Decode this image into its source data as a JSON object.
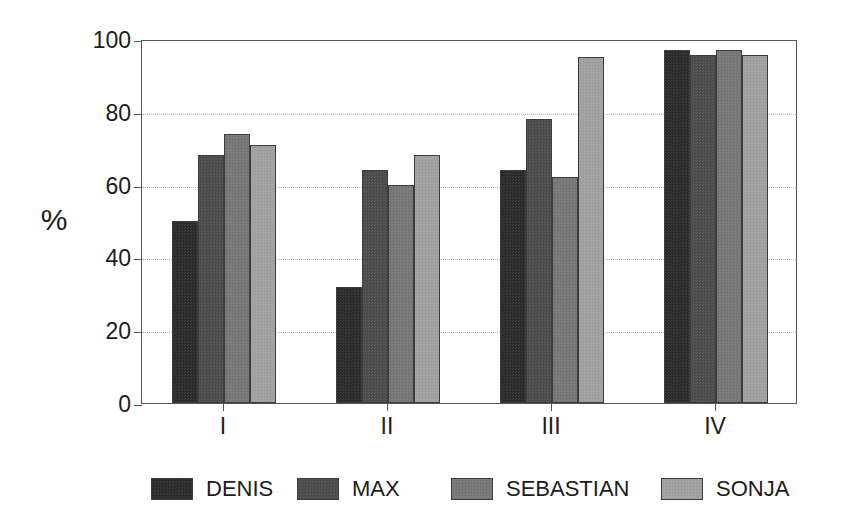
{
  "chart_data": {
    "type": "bar",
    "title": "",
    "subtitle": "",
    "xlabel": "",
    "ylabel": "%",
    "categories": [
      "I",
      "II",
      "III",
      "IV"
    ],
    "series": [
      {
        "name": "DENIS",
        "color": "#2b2b2b",
        "values": [
          50,
          32,
          64,
          97
        ]
      },
      {
        "name": "MAX",
        "color": "#4d4d4d",
        "values": [
          68,
          64,
          78,
          95.5
        ]
      },
      {
        "name": "SEBASTIAN",
        "color": "#787878",
        "values": [
          74,
          60,
          62,
          97
        ]
      },
      {
        "name": "SONJA",
        "color": "#a3a3a3",
        "values": [
          71,
          68,
          95,
          95.5
        ]
      }
    ],
    "ylim": [
      0,
      100
    ],
    "yticks": [
      0,
      20,
      40,
      60,
      80,
      100
    ],
    "ytick_labels": [
      "0",
      "20",
      "40",
      "60",
      "80",
      "100"
    ],
    "gridlines_at": [
      20,
      40,
      60,
      80
    ],
    "grid": true,
    "legend_position": "bottom",
    "bar_group_gap": true
  },
  "legend": {
    "items": [
      {
        "label": "DENIS"
      },
      {
        "label": "MAX"
      },
      {
        "label": "SEBASTIAN"
      },
      {
        "label": "SONJA"
      }
    ]
  }
}
